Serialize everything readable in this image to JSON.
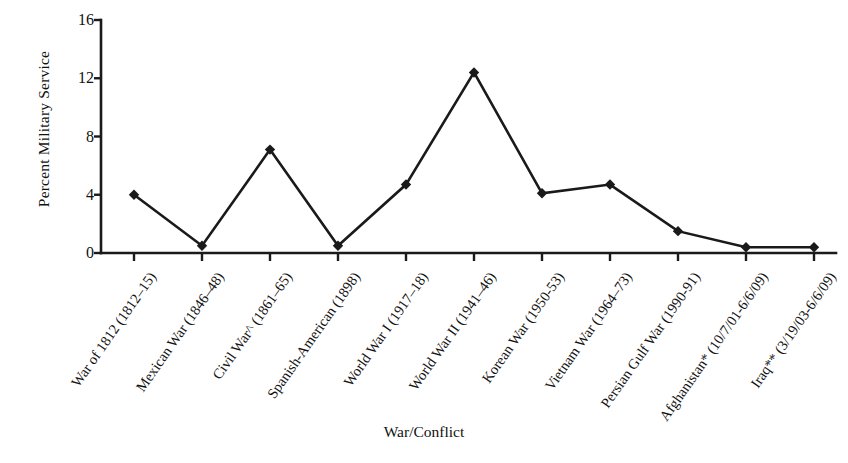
{
  "chart_data": {
    "type": "line",
    "title": "",
    "xlabel": "War/Conflict",
    "ylabel": "Percent Military Service",
    "ylim": [
      0,
      16
    ],
    "yticks": [
      0,
      4,
      8,
      12,
      16
    ],
    "grid": false,
    "legend": "none",
    "marker": "diamond",
    "line_color": "#1a1a1a",
    "categories": [
      "War of 1812 (1812–15)",
      "Mexican War (1846–48)",
      "Civil War^ (1861–65)",
      "Spanish-American (1898)",
      "World War I (1917–18)",
      "World War II (1941–46)",
      "Korean War (1950-53)",
      "Vietnam War (1964–73)",
      "Persian Gulf War (1990-91)",
      "Afghanistan* (10/7/01-6/6/09)",
      "Iraq** (3/19/03-6/6/09)"
    ],
    "values": [
      4.0,
      0.5,
      7.1,
      0.5,
      4.7,
      12.4,
      4.1,
      4.7,
      1.5,
      0.4,
      0.4
    ]
  },
  "axes": {
    "y_title": "Percent Military Service",
    "x_title": "War/Conflict",
    "y_tick_labels": [
      "16",
      "12",
      "8",
      "4",
      "0"
    ]
  }
}
